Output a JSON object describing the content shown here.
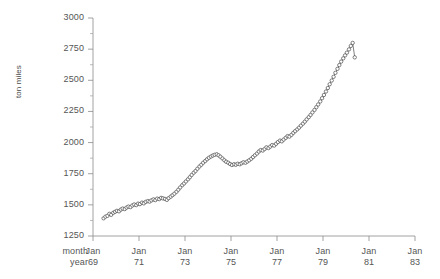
{
  "chart_data": {
    "type": "line",
    "title": "",
    "xlabel": "",
    "ylabel": "ton miles",
    "ylim": [
      1250,
      3000
    ],
    "ytick_values": [
      1250,
      1500,
      1750,
      2000,
      2250,
      2500,
      2750,
      3000
    ],
    "ytick_labels": [
      "1250",
      "1500",
      "1750",
      "2000",
      "2250",
      "2500",
      "2750",
      "3000"
    ],
    "xlim": [
      1969.0,
      1983.0
    ],
    "xtick_values": [
      1969,
      1971,
      1973,
      1975,
      1977,
      1979,
      1981,
      1983
    ],
    "xtick_labels": [
      "Jan\n69",
      "Jan\n71",
      "Jan\n73",
      "Jan\n75",
      "Jan\n77",
      "Jan\n79",
      "Jan\n81",
      "Jan\n83"
    ],
    "xtick_month_labels": [
      "Jan",
      "Jan",
      "Jan",
      "Jan",
      "Jan",
      "Jan",
      "Jan",
      "Jan"
    ],
    "xtick_year_labels": [
      "69",
      "71",
      "73",
      "75",
      "77",
      "79",
      "81",
      "83"
    ],
    "x_axis_row_labels": [
      "month",
      "year"
    ],
    "grid": false,
    "legend": null,
    "marker": "open-circle",
    "series_name": "ton miles",
    "x": [
      1969.46,
      1969.54,
      1969.63,
      1969.71,
      1969.79,
      1969.88,
      1969.96,
      1970.04,
      1970.13,
      1970.21,
      1970.29,
      1970.38,
      1970.46,
      1970.54,
      1970.63,
      1970.71,
      1970.79,
      1970.88,
      1970.96,
      1971.04,
      1971.13,
      1971.21,
      1971.29,
      1971.38,
      1971.46,
      1971.54,
      1971.63,
      1971.71,
      1971.79,
      1971.88,
      1971.96,
      1972.04,
      1972.13,
      1972.21,
      1972.29,
      1972.38,
      1972.46,
      1972.54,
      1972.63,
      1972.71,
      1972.79,
      1972.88,
      1972.96,
      1973.04,
      1973.13,
      1973.21,
      1973.29,
      1973.38,
      1973.46,
      1973.54,
      1973.63,
      1973.71,
      1973.79,
      1973.88,
      1973.96,
      1974.04,
      1974.13,
      1974.21,
      1974.29,
      1974.38,
      1974.46,
      1974.54,
      1974.63,
      1974.71,
      1974.79,
      1974.88,
      1974.96,
      1975.04,
      1975.13,
      1975.21,
      1975.29,
      1975.38,
      1975.46,
      1975.54,
      1975.63,
      1975.71,
      1975.79,
      1975.88,
      1975.96,
      1976.04,
      1976.13,
      1976.21,
      1976.29,
      1976.38,
      1976.46,
      1976.54,
      1976.63,
      1976.71,
      1976.79,
      1976.88,
      1976.96,
      1977.04,
      1977.13,
      1977.21,
      1977.29,
      1977.38,
      1977.46,
      1977.54,
      1977.63,
      1977.71,
      1977.79,
      1977.88,
      1977.96,
      1978.04,
      1978.13,
      1978.21,
      1978.29,
      1978.38,
      1978.46,
      1978.54,
      1978.63,
      1978.71,
      1978.79,
      1978.88,
      1978.96,
      1979.04,
      1979.13,
      1979.21,
      1979.29,
      1979.38,
      1979.46,
      1979.54,
      1979.63,
      1979.71,
      1979.79,
      1979.88,
      1979.96,
      1980.04,
      1980.13,
      1980.21,
      1980.29,
      1980.38
    ],
    "values": [
      1392,
      1405,
      1412,
      1428,
      1420,
      1436,
      1444,
      1452,
      1448,
      1462,
      1470,
      1466,
      1478,
      1486,
      1482,
      1495,
      1503,
      1498,
      1510,
      1506,
      1518,
      1512,
      1524,
      1530,
      1526,
      1536,
      1544,
      1538,
      1550,
      1546,
      1556,
      1552,
      1548,
      1540,
      1554,
      1566,
      1578,
      1590,
      1605,
      1622,
      1640,
      1658,
      1672,
      1688,
      1705,
      1722,
      1740,
      1758,
      1772,
      1790,
      1808,
      1822,
      1838,
      1852,
      1866,
      1878,
      1888,
      1896,
      1902,
      1906,
      1898,
      1886,
      1872,
      1858,
      1846,
      1838,
      1828,
      1820,
      1826,
      1822,
      1830,
      1826,
      1834,
      1842,
      1838,
      1848,
      1858,
      1870,
      1884,
      1898,
      1912,
      1928,
      1940,
      1936,
      1948,
      1962,
      1956,
      1968,
      1980,
      1976,
      1990,
      2004,
      2016,
      2010,
      2024,
      2038,
      2052,
      2048,
      2062,
      2078,
      2092,
      2106,
      2120,
      2136,
      2152,
      2168,
      2186,
      2204,
      2222,
      2242,
      2262,
      2284,
      2306,
      2330,
      2356,
      2382,
      2410,
      2438,
      2468,
      2498,
      2528,
      2560,
      2592,
      2622,
      2650,
      2676,
      2700,
      2722,
      2748,
      2776,
      2800,
      2684
    ]
  }
}
